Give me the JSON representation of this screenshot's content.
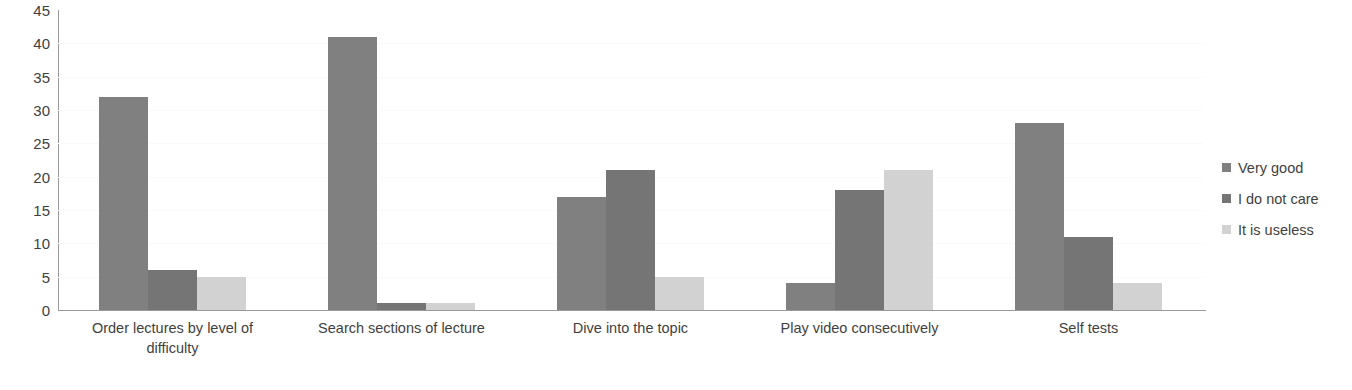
{
  "chart_data": {
    "type": "bar",
    "title": "",
    "subtitle": "",
    "xlabel": "",
    "ylabel": "",
    "ylim": [
      0,
      45
    ],
    "y_ticks": [
      0,
      5,
      10,
      15,
      20,
      25,
      30,
      35,
      40,
      45
    ],
    "grid": true,
    "legend_position": "right",
    "categories": [
      "Order lectures by level of difficulty",
      "Search sections of lecture",
      "Dive into the topic",
      "Play video consecutively",
      "Self tests"
    ],
    "category_lines": [
      [
        "Order lectures by level of",
        "difficulty"
      ],
      [
        "Search sections of lecture"
      ],
      [
        "Dive into the topic"
      ],
      [
        "Play video consecutively"
      ],
      [
        "Self tests"
      ]
    ],
    "series": [
      {
        "name": "Very good",
        "color": "#808080",
        "values": [
          32,
          41,
          17,
          4,
          28
        ]
      },
      {
        "name": "I do not care",
        "color": "#757575",
        "values": [
          6,
          1,
          21,
          18,
          11
        ]
      },
      {
        "name": "It is useless",
        "color": "#d2d2d2",
        "values": [
          5,
          1,
          5,
          21,
          4
        ]
      }
    ]
  }
}
